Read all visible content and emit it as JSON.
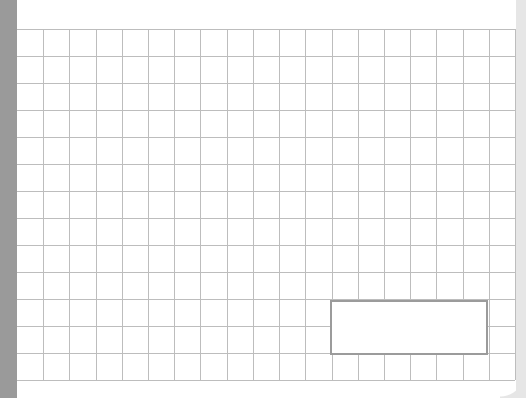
{
  "sheet": {
    "rows": 13,
    "columns": 19,
    "selection": {
      "label": "",
      "start_row": 11,
      "end_row": 12,
      "start_column": 13,
      "end_column": 18
    }
  },
  "colors": {
    "left_bar": "#9a9a9a",
    "right_bar": "#e6e6e6",
    "grid_line": "#bdbdbd",
    "selection_border": "#9b9b9b",
    "background": "#ffffff"
  }
}
